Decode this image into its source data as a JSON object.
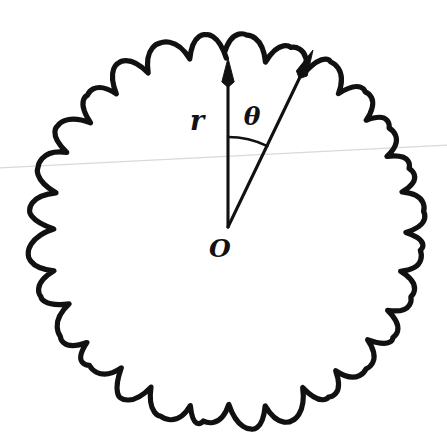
{
  "figure": {
    "background_color": "#ffffff",
    "ink_color": "#111111",
    "scan_line_color": "#d9d9d9",
    "width": 447,
    "height": 447
  },
  "labels": {
    "radius": "r",
    "angle": "θ",
    "origin": "O"
  },
  "geometry": {
    "origin": {
      "x": 228,
      "y": 227
    },
    "radius_arrow": {
      "from_x": 228,
      "from_y": 227,
      "to_x": 228,
      "to_y": 58,
      "length_px": 169,
      "direction_deg": 90
    },
    "angle_arrow": {
      "from_x": 228,
      "from_y": 227,
      "to_x": 313,
      "to_y": 50,
      "length_px": 196,
      "direction_deg": 64
    },
    "angle_between_deg": 26,
    "arc": {
      "radius_px": 90,
      "start_deg": 90,
      "end_deg": 64
    },
    "scan_line": {
      "x1": 0,
      "y1": 168,
      "x2": 447,
      "y2": 145
    }
  },
  "curve": {
    "type": "scalloped-closed-curve",
    "center_x": 227,
    "center_y": 231,
    "outer_radius": 196,
    "inner_radius": 176,
    "lobe_count": 28,
    "stroke_width": 5.2
  },
  "label_positions": {
    "radius": {
      "x": 197,
      "y": 122
    },
    "angle": {
      "x": 252,
      "y": 118
    },
    "origin": {
      "x": 220,
      "y": 250
    }
  }
}
